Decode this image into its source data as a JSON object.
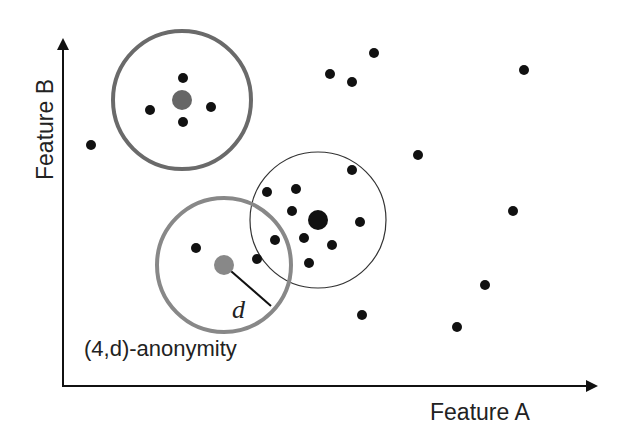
{
  "labels": {
    "x_axis": "Feature A",
    "y_axis": "Feature B",
    "annotation": "(4,d)-anonymity",
    "radius_symbol": "d"
  },
  "colors": {
    "axis": "#111111",
    "point": "#111111",
    "gray_center": "#777777",
    "thick_circle": "#6a6a6a",
    "light_thick_circle": "#888888",
    "thin_circle": "#333333"
  },
  "circles": [
    {
      "name": "top-left-cluster",
      "cx": 182,
      "cy": 100,
      "r": 69,
      "stroke_width": 4,
      "center": {
        "cx": 182,
        "cy": 100,
        "r": 10,
        "color": "#666666"
      }
    },
    {
      "name": "middle-cluster",
      "cx": 318,
      "cy": 220,
      "r": 68,
      "stroke_width": 1.2,
      "center": {
        "cx": 318,
        "cy": 220,
        "r": 10,
        "color": "#111111"
      }
    },
    {
      "name": "anonymity-cluster",
      "cx": 224,
      "cy": 265,
      "r": 67,
      "stroke_width": 4,
      "center": {
        "cx": 224,
        "cy": 265,
        "r": 10,
        "color": "#888888"
      }
    }
  ],
  "points": [
    {
      "x": 183,
      "y": 78
    },
    {
      "x": 150,
      "y": 110
    },
    {
      "x": 211,
      "y": 107
    },
    {
      "x": 183,
      "y": 122
    },
    {
      "x": 91,
      "y": 145
    },
    {
      "x": 330,
      "y": 74
    },
    {
      "x": 352,
      "y": 82
    },
    {
      "x": 374,
      "y": 53
    },
    {
      "x": 524,
      "y": 70
    },
    {
      "x": 418,
      "y": 155
    },
    {
      "x": 352,
      "y": 170
    },
    {
      "x": 267,
      "y": 192
    },
    {
      "x": 296,
      "y": 189
    },
    {
      "x": 292,
      "y": 211
    },
    {
      "x": 360,
      "y": 222
    },
    {
      "x": 275,
      "y": 240
    },
    {
      "x": 304,
      "y": 238
    },
    {
      "x": 332,
      "y": 245
    },
    {
      "x": 309,
      "y": 263
    },
    {
      "x": 257,
      "y": 259
    },
    {
      "x": 196,
      "y": 248
    },
    {
      "x": 513,
      "y": 211
    },
    {
      "x": 485,
      "y": 285
    },
    {
      "x": 362,
      "y": 315
    },
    {
      "x": 457,
      "y": 327
    }
  ],
  "radius_line": {
    "x1": 224,
    "y1": 265,
    "x2": 271,
    "y2": 306
  },
  "chart_data": {
    "type": "scatter",
    "title": "",
    "xlabel": "Feature A",
    "ylabel": "Feature B",
    "annotations": [
      "(4,d)-anonymity",
      "d"
    ],
    "grid": false,
    "legend": null,
    "series": [
      {
        "name": "records",
        "points_px": "see points"
      },
      {
        "name": "cluster-centers",
        "values": [
          [
            182,
            100
          ],
          [
            318,
            220
          ],
          [
            224,
            265
          ]
        ]
      }
    ]
  }
}
